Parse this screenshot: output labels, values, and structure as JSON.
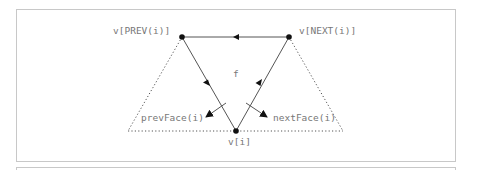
{
  "diagram": {
    "type": "mesh-vertex-face-adjacency",
    "colors": {
      "edge": "#555555",
      "dotted": "#555555",
      "vertex": "#111111",
      "label": "#777777",
      "frame": "#c8c8c8"
    },
    "vertices": [
      {
        "id": "prev",
        "label": "v[PREV(i)]",
        "x": 182,
        "y": 37
      },
      {
        "id": "next",
        "label": "v[NEXT(i)]",
        "x": 289,
        "y": 37
      },
      {
        "id": "vi",
        "label": "v[i]",
        "x": 236,
        "y": 131
      }
    ],
    "face_label": "f",
    "adjacent_faces": [
      {
        "id": "prevFace",
        "label": "prevFace(i)"
      },
      {
        "id": "nextFace",
        "label": "nextFace(i)"
      }
    ],
    "edges": [
      {
        "from": "next",
        "to": "prev",
        "style": "solid",
        "arrow": "mid"
      },
      {
        "from": "prev",
        "to": "vi",
        "style": "solid",
        "arrow": "mid"
      },
      {
        "from": "vi",
        "to": "next",
        "style": "solid",
        "arrow": "mid"
      },
      {
        "from": "prev",
        "to": "left-outer",
        "style": "dotted"
      },
      {
        "from": "next",
        "to": "right-outer",
        "style": "dotted"
      },
      {
        "from": "left-outer",
        "to": "right-outer",
        "style": "dotted"
      }
    ]
  }
}
